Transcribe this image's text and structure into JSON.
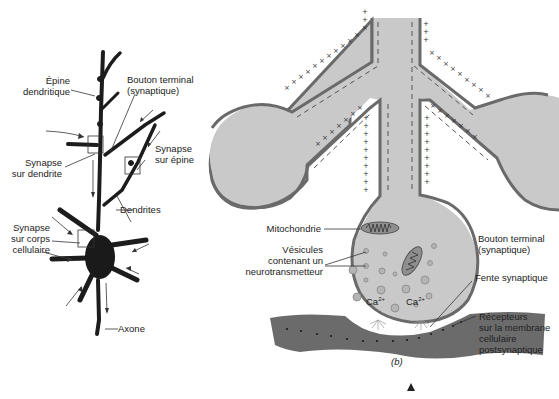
{
  "figure_a": {
    "labels": {
      "epine_1": "Épine",
      "epine_2": "dendritique",
      "bouton_1": "Bouton terminal",
      "bouton_2": "(synaptique)",
      "syn_epine_1": "Synapse",
      "syn_epine_2": "sur épine",
      "syn_dendrite_1": "Synapse",
      "syn_dendrite_2": "sur dendrite",
      "dendrites": "Dendrites",
      "syn_corps_1": "Synapse",
      "syn_corps_2": "sur corps",
      "syn_corps_3": "cellulaire",
      "axone": "Axone"
    }
  },
  "figure_b": {
    "caption": "(b)",
    "labels": {
      "mitochondrie": "Mitochondrie",
      "vesicules_1": "Vésicules",
      "vesicules_2": "contenant un",
      "vesicules_3": "neurotransmetteur",
      "bouton_1": "Bouton terminal",
      "bouton_2": "(synaptique)",
      "fente": "Fente synaptique",
      "recepteurs_1": "Récepteurs",
      "recepteurs_2": "sur la membrane",
      "recepteurs_3": "cellulaire",
      "recepteurs_4": "postsynaptique",
      "ca_left": "Ca",
      "ca_right": "Ca",
      "ca_sup": "2+"
    },
    "membrane_signs": {
      "outside": "+",
      "inside": "−"
    }
  },
  "colors": {
    "axoplasm": "#c9c9c9",
    "membrane": "#6a6a6a",
    "postsynaptic": "#6b6b6b",
    "ink": "#222222"
  }
}
